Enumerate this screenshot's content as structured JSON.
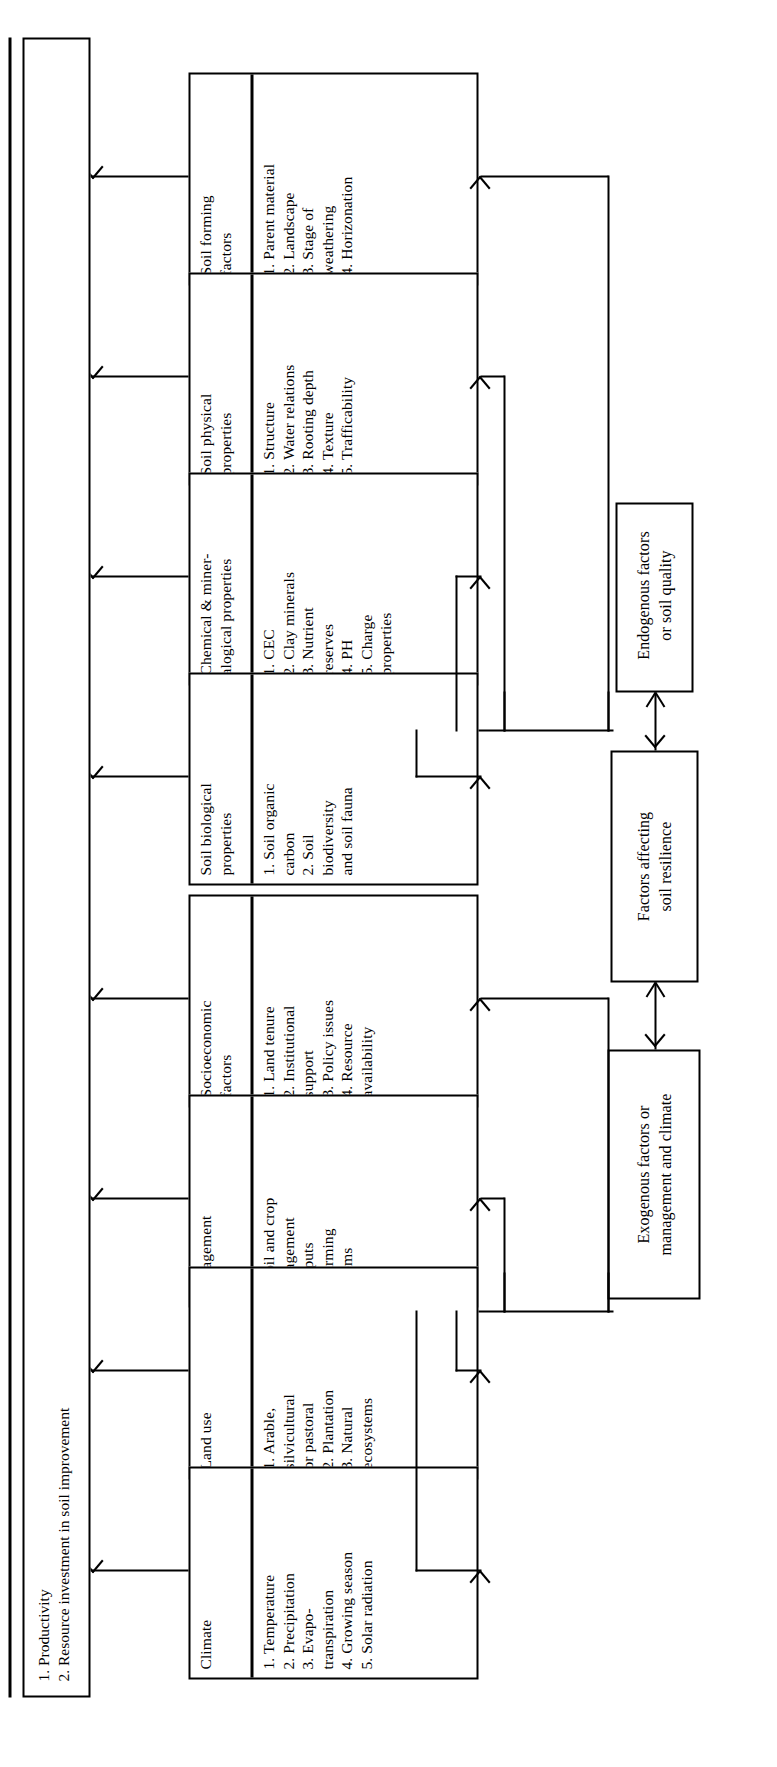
{
  "diagram": {
    "title": "Factors affecting soil resilience",
    "orientation": "rotated-90-ccw",
    "groups": [
      {
        "id": "endogenous",
        "label": "Endogenous factors\nor soil quality"
      },
      {
        "id": "resilience",
        "label": "Factors affecting\nsoil resilience"
      },
      {
        "id": "exogenous",
        "label": "Exogenous factors or\nmanagement and climate"
      }
    ],
    "factor_boxes": [
      {
        "id": "soil-forming-factors",
        "title": "Soil forming\nfactors",
        "items": [
          "1. Parent material",
          "2. Landscape",
          "3. Stage of\n    weathering",
          "4. Horizonation"
        ]
      },
      {
        "id": "soil-physical-properties",
        "title": "Soil physical\nproperties",
        "items": [
          "1. Structure",
          "2. Water relations",
          "3. Rooting depth",
          "4. Texture",
          "5. Trafficability"
        ]
      },
      {
        "id": "chemical-mineralogical-properties",
        "title": "Chemical & miner-\nalogical properties",
        "items": [
          "1. CEC",
          "2. Clay minerals",
          "3. Nutrient\n    reserves",
          "4. PH",
          "5. Charge\n    properties"
        ]
      },
      {
        "id": "soil-biological-properties",
        "title": "Soil biological\nproperties",
        "items": [
          "1. Soil organic\n    carbon",
          "2. Soil\n    biodiversity\n    and soil fauna"
        ]
      },
      {
        "id": "socioeconomic-factors",
        "title": "Socioeconomic\nfactors",
        "items": [
          "1. Land tenure",
          "2. Institutional\n    support",
          "3. Policy issues",
          "4. Resource\n    availability"
        ]
      },
      {
        "id": "management",
        "title": "Management",
        "items": [
          "1. Soil and crop\n    management",
          "2. Inputs",
          "3. Farming\n    systems"
        ]
      },
      {
        "id": "land-use",
        "title": "Land use",
        "items": [
          "1. Arable,\n    silvicultural\n    or pastoral",
          "2. Plantation",
          "3. Natural\n    ecosystems"
        ]
      },
      {
        "id": "climate",
        "title": "Climate",
        "items": [
          "1. Temperature",
          "2. Precipitation",
          "3. Evapo-\n    transpiration",
          "4. Growing season",
          "5. Solar radiation"
        ]
      }
    ],
    "outcome": {
      "id": "outcome",
      "items": [
        "1. Productivity",
        "2. Resource investment in soil improvement"
      ]
    }
  }
}
